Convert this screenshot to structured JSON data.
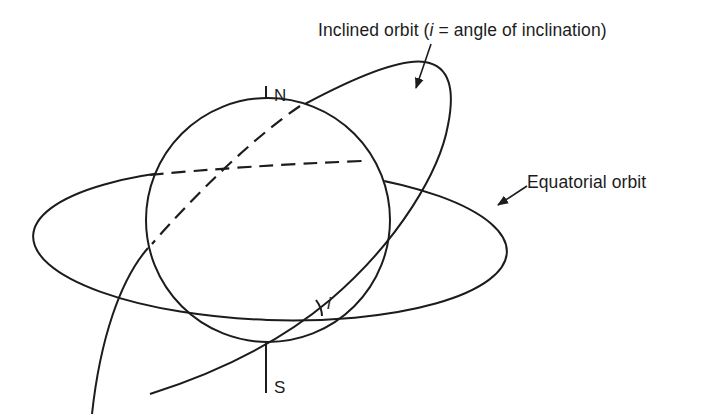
{
  "diagram": {
    "labels": {
      "north": "N",
      "south": "S",
      "inclined_orbit_prefix": "Inclined orbit (",
      "inclined_orbit_symbol": "i",
      "inclined_orbit_suffix": " = angle of inclination)",
      "equatorial_orbit": "Equatorial orbit",
      "angle_symbol": "i"
    },
    "elements": [
      {
        "name": "earth-sphere",
        "shape": "circle"
      },
      {
        "name": "polar-axis",
        "ends": [
          "N",
          "S"
        ]
      },
      {
        "name": "equatorial-orbit",
        "shape": "ellipse",
        "hidden_part": "dashed"
      },
      {
        "name": "inclined-orbit",
        "shape": "tilted ellipse",
        "hidden_part": "dashed"
      },
      {
        "name": "inclination-angle-arc",
        "symbol": "i"
      }
    ],
    "colors": {
      "line": "#1c1c1c",
      "background": "#ffffff"
    }
  }
}
